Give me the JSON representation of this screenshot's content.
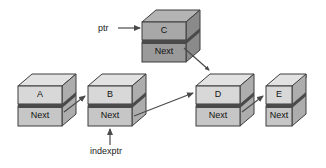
{
  "diagram": {
    "pointer_labels": {
      "ptr": "ptr",
      "indexptr": "indexptr"
    },
    "next_field_label": "Next",
    "colors": {
      "node_top_face": "#e0e0e0",
      "node_front_face_data": "#d4d4d4",
      "node_front_face_next": "#c0c0c0",
      "node_side_face": "#a8a8a8",
      "node_c_top_face": "#b0b0b0",
      "node_c_front_face_data": "#a0a0a0",
      "node_c_front_face_next": "#909090",
      "node_c_side_face": "#7a7a7a",
      "outline": "#3c3c3c",
      "arrow": "#4a4a4a",
      "text": "#111111",
      "background": "#ffffff"
    },
    "nodes": [
      {
        "id": "A",
        "data_label": "A",
        "next_label": "Next",
        "row": "bottom",
        "x": 18,
        "y": 74
      },
      {
        "id": "B",
        "data_label": "B",
        "next_label": "Next",
        "row": "bottom",
        "x": 88,
        "y": 74
      },
      {
        "id": "C",
        "data_label": "C",
        "next_label": "Next",
        "row": "top",
        "x": 142,
        "y": 10
      },
      {
        "id": "D",
        "data_label": "D",
        "next_label": "Next",
        "row": "bottom",
        "x": 196,
        "y": 74
      },
      {
        "id": "E",
        "data_label": "E",
        "next_label": "Next",
        "row": "bottom",
        "x": 266,
        "y": 74
      }
    ],
    "links": [
      {
        "from": "A",
        "to": "B",
        "kind": "next-pointer"
      },
      {
        "from": "B",
        "to": "D",
        "kind": "next-pointer"
      },
      {
        "from": "C",
        "to": "D",
        "kind": "next-pointer"
      },
      {
        "from": "D",
        "to": "E",
        "kind": "next-pointer"
      },
      {
        "from": "ptr",
        "to": "C",
        "kind": "variable-pointer"
      },
      {
        "from": "indexptr",
        "to": "B",
        "kind": "variable-pointer"
      }
    ]
  }
}
